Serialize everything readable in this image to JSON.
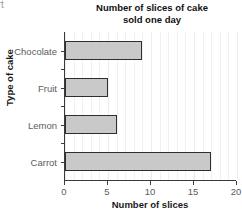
{
  "crop_fragment": "rt",
  "chart_data": {
    "type": "bar",
    "orientation": "horizontal",
    "title": "Number of slices of cake sold one day",
    "title_lines": [
      "Number of slices of cake",
      "sold one day"
    ],
    "categories": [
      "Chocolate",
      "Fruit",
      "Lemon",
      "Carrot"
    ],
    "values": [
      9,
      5,
      6,
      17
    ],
    "xlabel": "Number of slices",
    "ylabel": "Type of cake",
    "xlim": [
      0,
      20
    ],
    "xticks": [
      0,
      5,
      10,
      15,
      20
    ],
    "xtick_labels": [
      "0",
      "5",
      "10",
      "15",
      "20"
    ],
    "grid": true,
    "grid_axis": "x",
    "grid_step": 1,
    "legend": null,
    "bar_fill_color": "#c9c9c9",
    "bar_edge_color": "#2e2e2e",
    "axis_color": "#3b3b3b",
    "grid_color": "#f0f0f0",
    "tick_label_color": "#5c5c5c",
    "axis_title_color": "#1a1a1a"
  }
}
